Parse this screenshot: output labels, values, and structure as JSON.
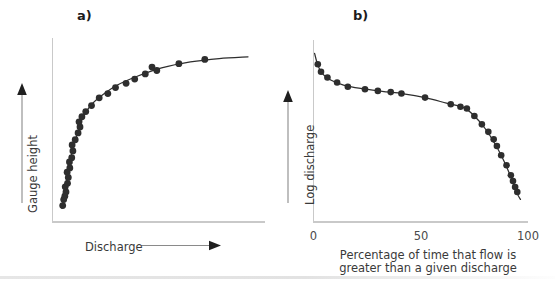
{
  "figure": {
    "background_color": "#ffffff",
    "marker_color": "#2e2e2e",
    "axis_color": "#c9c9c9",
    "text_color": "#3a3a3a"
  },
  "panel_a": {
    "label": "a)",
    "y_axis_title": "Gauge height",
    "x_axis_title": "Discharge",
    "y_arrow": "up-arrow",
    "x_arrow": "right-arrow"
  },
  "panel_b": {
    "label": "b)",
    "y_axis_title": "Log discharge",
    "y_arrow": "up-arrow",
    "x_caption_line1": "Percentage of time that flow is",
    "x_caption_line2": "greater than a given discharge",
    "x_ticks": [
      "0",
      "50",
      "100"
    ]
  },
  "chart_data": [
    {
      "type": "scatter",
      "title": "a)",
      "xlabel": "Discharge",
      "ylabel": "Gauge height",
      "xlim": [
        0,
        100
      ],
      "ylim": [
        0,
        100
      ],
      "grid": false,
      "legend": "none",
      "axis_ticks": false,
      "description": "Rating curve: gauge height versus discharge, concave-down rising curve fitted through scattered observations.",
      "points": [
        {
          "x": 3.5,
          "y": 5.5
        },
        {
          "x": 4.0,
          "y": 9.0
        },
        {
          "x": 4.6,
          "y": 11.0
        },
        {
          "x": 5.2,
          "y": 13.5
        },
        {
          "x": 4.8,
          "y": 16.5
        },
        {
          "x": 6.0,
          "y": 18.5
        },
        {
          "x": 6.4,
          "y": 22.0
        },
        {
          "x": 5.8,
          "y": 25.0
        },
        {
          "x": 7.2,
          "y": 27.5
        },
        {
          "x": 7.0,
          "y": 31.0
        },
        {
          "x": 8.2,
          "y": 33.5
        },
        {
          "x": 8.8,
          "y": 37.5
        },
        {
          "x": 8.4,
          "y": 41.0
        },
        {
          "x": 10.0,
          "y": 44.0
        },
        {
          "x": 11.5,
          "y": 48.0
        },
        {
          "x": 12.5,
          "y": 51.5
        },
        {
          "x": 12.0,
          "y": 54.5
        },
        {
          "x": 13.5,
          "y": 57.5
        },
        {
          "x": 15.5,
          "y": 60.5
        },
        {
          "x": 18.5,
          "y": 64.0
        },
        {
          "x": 22.5,
          "y": 68.5
        },
        {
          "x": 27.0,
          "y": 71.0
        },
        {
          "x": 31.0,
          "y": 74.5
        },
        {
          "x": 36.5,
          "y": 77.0
        },
        {
          "x": 41.0,
          "y": 79.5
        },
        {
          "x": 46.5,
          "y": 82.5
        },
        {
          "x": 50.0,
          "y": 86.5
        },
        {
          "x": 52.5,
          "y": 84.5
        },
        {
          "x": 64.0,
          "y": 88.5
        },
        {
          "x": 77.5,
          "y": 91.0
        }
      ],
      "fit_curve": [
        {
          "x": 3.0,
          "y": 4.0
        },
        {
          "x": 5.0,
          "y": 16.0
        },
        {
          "x": 7.0,
          "y": 29.0
        },
        {
          "x": 9.0,
          "y": 40.0
        },
        {
          "x": 11.0,
          "y": 47.0
        },
        {
          "x": 14.0,
          "y": 57.0
        },
        {
          "x": 18.0,
          "y": 64.0
        },
        {
          "x": 24.0,
          "y": 70.0
        },
        {
          "x": 32.0,
          "y": 76.0
        },
        {
          "x": 42.0,
          "y": 81.0
        },
        {
          "x": 55.0,
          "y": 86.0
        },
        {
          "x": 70.0,
          "y": 89.5
        },
        {
          "x": 85.0,
          "y": 91.5
        },
        {
          "x": 100.0,
          "y": 92.5
        }
      ]
    },
    {
      "type": "scatter",
      "title": "b)",
      "xlabel": "Percentage of time that flow is greater than a given discharge",
      "ylabel": "Log discharge",
      "xlim": [
        0,
        100
      ],
      "ylim": [
        0,
        100
      ],
      "xticks": [
        0,
        50,
        100
      ],
      "xticklabels": [
        "0",
        "50",
        "100"
      ],
      "grid": false,
      "legend": "none",
      "description": "Flow duration curve: log discharge decreasing with percentage exceedance, gentle mid slope and steep fall beyond 80 percent.",
      "points": [
        {
          "x": 2.0,
          "y": 88.5
        },
        {
          "x": 3.5,
          "y": 84.0
        },
        {
          "x": 6.5,
          "y": 80.5
        },
        {
          "x": 11.0,
          "y": 77.5
        },
        {
          "x": 16.0,
          "y": 75.0
        },
        {
          "x": 24.0,
          "y": 73.5
        },
        {
          "x": 30.0,
          "y": 72.5
        },
        {
          "x": 36.0,
          "y": 71.8
        },
        {
          "x": 41.0,
          "y": 71.0
        },
        {
          "x": 52.0,
          "y": 68.5
        },
        {
          "x": 64.0,
          "y": 64.5
        },
        {
          "x": 68.5,
          "y": 63.0
        },
        {
          "x": 71.5,
          "y": 62.0
        },
        {
          "x": 75.0,
          "y": 57.5
        },
        {
          "x": 78.5,
          "y": 52.5
        },
        {
          "x": 81.5,
          "y": 48.0
        },
        {
          "x": 84.0,
          "y": 43.5
        },
        {
          "x": 85.5,
          "y": 39.5
        },
        {
          "x": 87.5,
          "y": 34.0
        },
        {
          "x": 90.0,
          "y": 28.0
        },
        {
          "x": 92.0,
          "y": 22.0
        },
        {
          "x": 93.0,
          "y": 18.5
        },
        {
          "x": 94.0,
          "y": 15.0
        },
        {
          "x": 95.0,
          "y": 12.0
        }
      ],
      "fit_curve": [
        {
          "x": 0.5,
          "y": 95.0
        },
        {
          "x": 2.0,
          "y": 88.0
        },
        {
          "x": 4.0,
          "y": 83.0
        },
        {
          "x": 8.0,
          "y": 79.0
        },
        {
          "x": 14.0,
          "y": 76.0
        },
        {
          "x": 22.0,
          "y": 74.0
        },
        {
          "x": 32.0,
          "y": 72.3
        },
        {
          "x": 42.0,
          "y": 70.8
        },
        {
          "x": 52.0,
          "y": 68.5
        },
        {
          "x": 62.0,
          "y": 65.2
        },
        {
          "x": 70.0,
          "y": 62.5
        },
        {
          "x": 75.0,
          "y": 57.5
        },
        {
          "x": 80.0,
          "y": 50.0
        },
        {
          "x": 85.0,
          "y": 40.0
        },
        {
          "x": 89.0,
          "y": 30.0
        },
        {
          "x": 92.0,
          "y": 21.0
        },
        {
          "x": 95.0,
          "y": 11.0
        },
        {
          "x": 96.5,
          "y": 7.5
        }
      ]
    }
  ]
}
